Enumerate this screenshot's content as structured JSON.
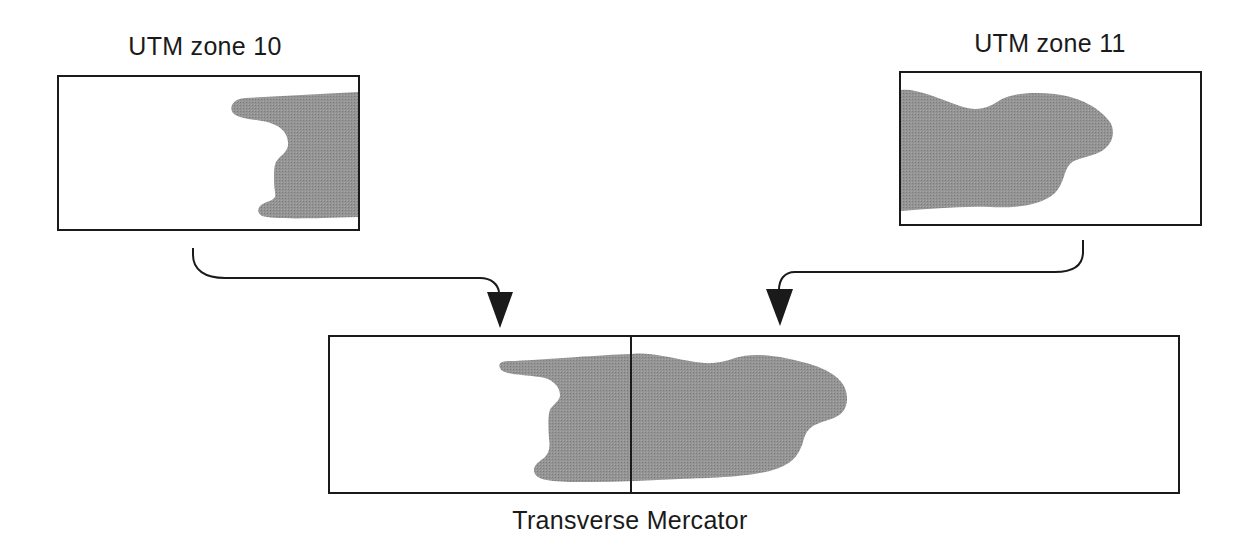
{
  "diagram": {
    "type": "map-projection-merge",
    "colors": {
      "stroke": "#1a1a1a",
      "landmass_fill": "#8f8f8f",
      "background": "#ffffff"
    },
    "nodes": [
      {
        "id": "zone10",
        "label": "UTM zone 10"
      },
      {
        "id": "zone11",
        "label": "UTM zone 11"
      },
      {
        "id": "merged",
        "label": "Transverse Mercator"
      }
    ],
    "edges": [
      {
        "from": "zone10",
        "to": "merged"
      },
      {
        "from": "zone11",
        "to": "merged"
      }
    ]
  }
}
